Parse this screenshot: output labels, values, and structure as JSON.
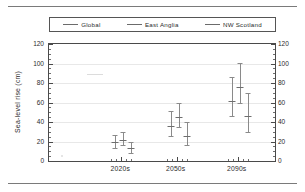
{
  "figure": {
    "has_top_rule": true,
    "has_bottom_rule": true
  },
  "legend": {
    "position": "above-plot",
    "entries": [
      {
        "label": "Global",
        "color": "#6b6b6b",
        "marker": "line-swatch"
      },
      {
        "label": "East Anglia",
        "color": "#6b6b6b",
        "marker": "line-swatch"
      },
      {
        "label": "NW Scotland",
        "color": "#6b6b6b",
        "marker": "line-swatch"
      }
    ]
  },
  "chart_data": {
    "type": "bar",
    "subtype": "error-bar-whisker",
    "title": "",
    "xlabel": "",
    "ylabel": "Sea-level rise (cm)",
    "categories": [
      "2020s",
      "2050s",
      "2090s"
    ],
    "ylim": [
      0,
      120
    ],
    "ytick_values": [
      0,
      20,
      40,
      60,
      80,
      100,
      120
    ],
    "ytick_labels": [
      "0",
      "20",
      "40",
      "60",
      "80",
      "100",
      "120"
    ],
    "ytick_minor_step": 5,
    "yaxis_mirrored": true,
    "grid": "horizontal-only",
    "legend_position": "top-outside",
    "series": [
      {
        "name": "Global",
        "color": "#8a8a8a",
        "values": [
          19,
          36,
          62
        ],
        "lower": [
          13,
          26,
          46
        ],
        "upper": [
          27,
          51,
          86
        ]
      },
      {
        "name": "East Anglia",
        "color": "#8a8a8a",
        "values": [
          22,
          45,
          76
        ],
        "lower": [
          16,
          35,
          59
        ],
        "upper": [
          30,
          59,
          101
        ]
      },
      {
        "name": "NW Scotland",
        "color": "#8a8a8a",
        "values": [
          13,
          26,
          46
        ],
        "lower": [
          8,
          16,
          30
        ],
        "upper": [
          19,
          40,
          70
        ]
      }
    ],
    "category_x_fraction": [
      0.32,
      0.565,
      0.835
    ],
    "series_x_offset_px": [
      -6,
      2,
      10
    ]
  }
}
